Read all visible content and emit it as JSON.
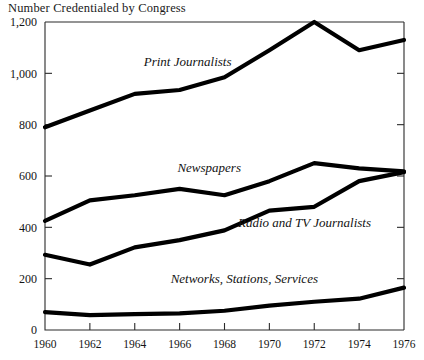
{
  "chart": {
    "title": "Number Credentialed by Congress"
  },
  "chart_data": {
    "type": "line",
    "title": "Number Credentialed by Congress",
    "xlabel": "",
    "ylabel": "",
    "x": [
      1960,
      1962,
      1964,
      1966,
      1968,
      1970,
      1972,
      1974,
      1976
    ],
    "xtick_labels": [
      "1960",
      "1962",
      "1964",
      "1966",
      "1968",
      "1970",
      "1972",
      "1974",
      "1976"
    ],
    "ytick_labels": [
      "0",
      "200",
      "400",
      "600",
      "800",
      "1,000",
      "1,200"
    ],
    "ytick_values": [
      0,
      200,
      400,
      600,
      800,
      1000,
      1200
    ],
    "xlim": [
      1960,
      1976
    ],
    "ylim": [
      0,
      1200
    ],
    "grid": false,
    "legend": "inline-labels",
    "line_color": "#000000",
    "series": [
      {
        "name": "Print Journalists",
        "label": "Print Journalists",
        "values": [
          790,
          855,
          920,
          935,
          985,
          1090,
          1200,
          1090,
          1130
        ]
      },
      {
        "name": "Newspapers",
        "label": "Newspapers",
        "values": [
          425,
          505,
          525,
          550,
          525,
          580,
          650,
          630,
          618
        ]
      },
      {
        "name": "Radio and TV Journalists",
        "label": "Radio and TV Journalists",
        "values": [
          293,
          255,
          322,
          350,
          388,
          465,
          480,
          580,
          615
        ]
      },
      {
        "name": "Networks, Stations, Services",
        "label": "Networks, Stations, Services",
        "values": [
          70,
          58,
          62,
          65,
          75,
          95,
          110,
          122,
          165
        ]
      }
    ],
    "annotations": [
      {
        "text": "Print Journalists",
        "x": 1964.4,
        "y": 1030
      },
      {
        "text": "Newspapers",
        "x": 1965.9,
        "y": 617
      },
      {
        "text": "Radio and TV Journalists",
        "x": 1968.6,
        "y": 400
      },
      {
        "text": "Networks, Stations, Services",
        "x": 1965.6,
        "y": 185
      }
    ]
  }
}
